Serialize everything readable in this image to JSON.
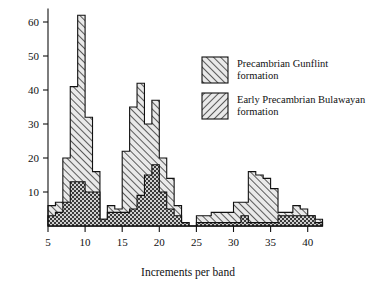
{
  "chart_data": {
    "type": "bar",
    "title": "",
    "subtitle": "",
    "xlabel": "Increments per band",
    "ylabel": "",
    "xlim": [
      4,
      42
    ],
    "ylim": [
      0,
      64
    ],
    "grid": false,
    "legend_position": "top-right",
    "xticks": [
      5,
      10,
      15,
      20,
      25,
      30,
      35,
      40
    ],
    "xtick_labels": [
      "5",
      "10",
      "15",
      "20",
      "25",
      "30",
      "35",
      "40"
    ],
    "yticks": [
      10,
      20,
      30,
      40,
      50,
      60
    ],
    "ytick_labels": [
      "10",
      "20",
      "30",
      "40",
      "50",
      "60"
    ],
    "bin_width": 1,
    "x": [
      5,
      6,
      7,
      8,
      9,
      10,
      11,
      12,
      13,
      14,
      15,
      16,
      17,
      18,
      19,
      20,
      21,
      22,
      23,
      24,
      25,
      26,
      27,
      28,
      29,
      30,
      31,
      32,
      33,
      34,
      35,
      36,
      37,
      38,
      39,
      40,
      41
    ],
    "series": [
      {
        "name": "Precambrian Gunflint formation",
        "pattern": "diagonal-hatch-right",
        "color": "#d8d8d8",
        "values": [
          6,
          7,
          20,
          41,
          62,
          32,
          16,
          2,
          6,
          5,
          22,
          35,
          42,
          30,
          37,
          20,
          14,
          6,
          1,
          0,
          3,
          3,
          4,
          4,
          4,
          7,
          7,
          16,
          15,
          14,
          11,
          4,
          4,
          6,
          5,
          3,
          2
        ]
      },
      {
        "name": "Early Precambrian Bulawayan formation",
        "pattern": "cross-hatch-dark",
        "color": "#9a9a9a",
        "values": [
          3,
          4,
          7,
          13,
          13,
          10,
          10,
          2,
          4,
          4,
          4,
          5,
          9,
          15,
          18,
          10,
          5,
          3,
          1,
          0,
          1,
          1,
          1,
          1,
          1,
          1,
          3,
          1,
          1,
          1,
          1,
          3,
          3,
          3,
          3,
          3,
          1
        ]
      }
    ]
  },
  "legend": {
    "entries": [
      {
        "label_line1": "Precambrian Gunflint",
        "label_line2": "formation",
        "swatch_name": "gunflint-swatch"
      },
      {
        "label_line1": "Early Precambrian Bulawayan",
        "label_line2": "formation",
        "swatch_name": "bulawayan-swatch"
      }
    ]
  },
  "axes": {
    "x_title": "Increments per band"
  }
}
